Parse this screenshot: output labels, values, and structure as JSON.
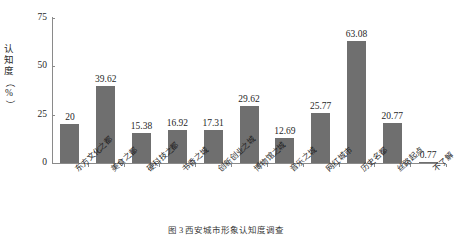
{
  "chart_data": {
    "type": "bar",
    "title": "",
    "xlabel": "",
    "ylabel": "认知度（%）",
    "ylim": [
      0,
      75
    ],
    "yticks": [
      0,
      25,
      50,
      75
    ],
    "ytick_labels": [
      "0",
      "25",
      "50",
      "75"
    ],
    "grid": false,
    "legend": null,
    "legend_position": "none",
    "bar_color": "#6f6f6f",
    "axis_color": "#8a8a8a",
    "text_color": "#1f1f1f",
    "value_label_precision": "as-shown",
    "categories": [
      "东方文化之都",
      "美食之都",
      "硬科技之都",
      "书香之城",
      "创新创业之城",
      "博物馆之城",
      "音乐之城",
      "网红城市",
      "历史名都",
      "丝路起点",
      "不了解"
    ],
    "values": [
      20,
      39.62,
      15.38,
      16.92,
      17.31,
      29.62,
      12.69,
      25.77,
      63.08,
      20.77,
      0.77
    ],
    "value_labels": [
      "20",
      "39.62",
      "15.38",
      "16.92",
      "17.31",
      "29.62",
      "12.69",
      "25.77",
      "63.08",
      "20.77",
      "0.77"
    ]
  },
  "axis": {
    "y_title_chars": [
      "认",
      "知",
      "度"
    ],
    "y_title_paren_open": "（",
    "y_title_unit": "%",
    "y_title_paren_close": "）"
  },
  "caption": {
    "text": "图 3  西安城市形象认知度调查"
  }
}
